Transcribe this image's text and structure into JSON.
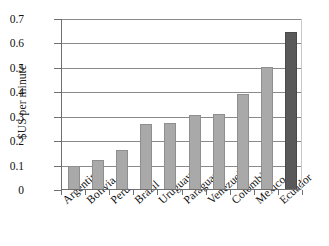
{
  "chart_data": {
    "type": "bar",
    "title": "",
    "subtitle": "",
    "xlabel": "",
    "ylabel": "$US per minute",
    "ylim": [
      0,
      0.7
    ],
    "ytick_labels": [
      "0",
      "0.1",
      "0.2",
      "0.3",
      "0.4",
      "0.5",
      "0.6",
      "0.7"
    ],
    "ytick_values": [
      0,
      0.1,
      0.2,
      0.3,
      0.4,
      0.5,
      0.6,
      0.7
    ],
    "grid": "horizontal",
    "legend": "none",
    "categories": [
      "Argentina",
      "Bolivia",
      "Peru",
      "Brazil",
      "Uruguay",
      "Paraguay",
      "Venezuela",
      "Colombia",
      "Mexico",
      "Ecuador"
    ],
    "values": [
      0.1,
      0.122,
      0.162,
      0.272,
      0.273,
      0.309,
      0.313,
      0.393,
      0.503,
      0.645
    ],
    "bar_colors": [
      "#a9a9a9",
      "#a9a9a9",
      "#a9a9a9",
      "#a9a9a9",
      "#a9a9a9",
      "#a9a9a9",
      "#a9a9a9",
      "#a9a9a9",
      "#a9a9a9",
      "#595959"
    ],
    "highlight_category": "Ecuador",
    "colors": {
      "bar_default": "#a9a9a9",
      "bar_highlight": "#595959",
      "gridline": "#8a8a8a",
      "axis": "#6f6f6f",
      "text": "#111111",
      "background": "#ffffff"
    }
  }
}
